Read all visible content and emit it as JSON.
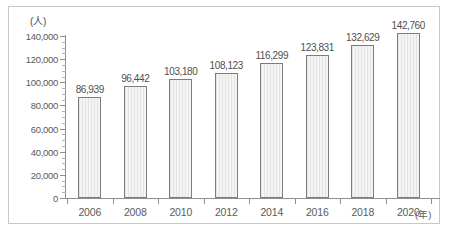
{
  "chart_data": {
    "type": "bar",
    "title": "",
    "xlabel": "年",
    "ylabel": "人",
    "y_unit_label": "(人)",
    "x_unit_label": "(年)",
    "categories": [
      "2006",
      "2008",
      "2010",
      "2012",
      "2014",
      "2016",
      "2018",
      "2020"
    ],
    "values": [
      86939,
      96442,
      103180,
      108123,
      116299,
      123831,
      132629,
      142760
    ],
    "value_labels": [
      "86,939",
      "96,442",
      "103,180",
      "108,123",
      "116,299",
      "123,831",
      "132,629",
      "142,760"
    ],
    "ylim": [
      0,
      140000
    ],
    "y_ticks": [
      0,
      20000,
      40000,
      60000,
      80000,
      100000,
      120000,
      140000
    ],
    "y_tick_labels": [
      "0",
      "20,000",
      "40,000",
      "60,000",
      "80,000",
      "100,000",
      "120,000",
      "140,000"
    ],
    "y_minor_tick_interval": 5000,
    "grid": false,
    "legend": null,
    "colors": {
      "bar_fill": "#ebebeb",
      "bar_border": "#7d7d7d",
      "axis": "#8f8f8f",
      "text": "#5a5a5a",
      "frame": "#c8c8c8",
      "background": "#ffffff"
    }
  }
}
